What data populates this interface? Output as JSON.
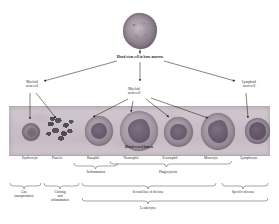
{
  "figure": {
    "type": "biology-diagram"
  },
  "nodes": {
    "root": "Blood stem cell in bone marrow",
    "myeloid_left": "Myeloid\nstem cell",
    "myeloid_center": "Myeloid\nstem cell",
    "lymphoid_right": "Lymphoid\nstem cell",
    "vessel": "Blood vessel lumen"
  },
  "cells": [
    {
      "name": "Erythrocyte",
      "x": 30
    },
    {
      "name": "Platelet",
      "x": 57
    },
    {
      "name": "Basophil",
      "x": 93
    },
    {
      "name": "Neutrophil",
      "x": 131
    },
    {
      "name": "Eosinophil",
      "x": 170
    },
    {
      "name": "Monocyte",
      "x": 211
    },
    {
      "name": "Lymphocyte",
      "x": 249
    }
  ],
  "functions_upper": [
    {
      "label": "Inflammation",
      "x": 96
    },
    {
      "label": "Phagocytosis",
      "x": 168
    }
  ],
  "functions_lower": [
    {
      "label": "Gas\ntransportation",
      "x": 24
    },
    {
      "label": "Clotting\nand\ninflammation",
      "x": 60
    },
    {
      "label": "Second line of defense",
      "x": 148
    },
    {
      "label": "Specific defense",
      "x": 243
    }
  ],
  "summary": {
    "label": "Leukocytes",
    "x": 148
  },
  "colors": {
    "ink": "#2a2a2a",
    "vessel_fill": "#cabfc8",
    "vessel_edge": "#b0a5b0",
    "erythrocyte": "#7e6f7c",
    "platelet": "#5f5362",
    "basophil": "#8a7c8a",
    "neutrophil": "#9a8c98",
    "eosinophil": "#8e8190",
    "monocyte": "#8a7d8c",
    "lymphocyte": "#857888"
  }
}
